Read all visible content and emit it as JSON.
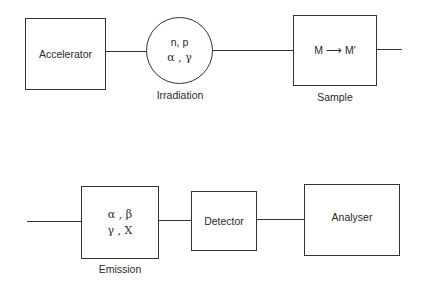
{
  "top_row": {
    "accelerator": {
      "label": "Accelerator"
    },
    "irradiation": {
      "line1": "n, p",
      "line2": "α , γ",
      "caption": "Irradiation"
    },
    "sample": {
      "content": "M ⟶ M′",
      "caption": "Sample"
    }
  },
  "bottom_row": {
    "emission": {
      "line1": "α , β",
      "line2": "γ , X",
      "caption": "Emission"
    },
    "detector": {
      "label": "Detector"
    },
    "analyser": {
      "label": "Analyser"
    }
  }
}
